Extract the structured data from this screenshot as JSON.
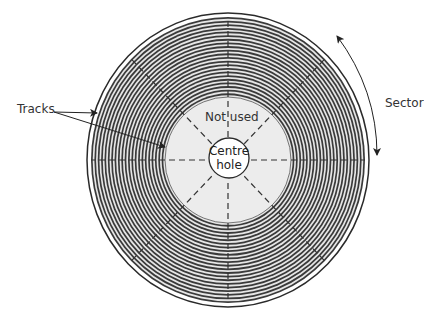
{
  "diagram": {
    "labels": {
      "tracks": "Tracks",
      "sector": "Sector",
      "not_used": "Not used",
      "centre_hole_line1": "Centre",
      "centre_hole_line2": "hole"
    },
    "colors": {
      "background": "#ffffff",
      "track_dark": "#3a3a3a",
      "track_light": "#e6e6e6",
      "unused_area": "#ececec",
      "centre_hole": "#ffffff",
      "outline": "#2a2a2a",
      "label_text": "#333333"
    },
    "geometry": {
      "center_x": 228,
      "center_y": 160,
      "outer_rx": 141,
      "outer_ry": 147,
      "unused_r": 63,
      "hole_r": 20,
      "track_count": 22,
      "sector_lines": 8
    }
  }
}
